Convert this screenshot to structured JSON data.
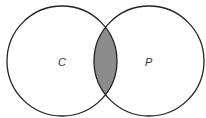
{
  "diagram": {
    "type": "venn",
    "sets": [
      {
        "label": "C",
        "cx": 62,
        "cy": 61,
        "r": 55
      },
      {
        "label": "P",
        "cx": 149,
        "cy": 61,
        "r": 55
      }
    ],
    "shaded_region": "C ∩ P",
    "colors": {
      "stroke": "#222222",
      "shade": "#8c8c8c",
      "background": "#ffffff"
    }
  }
}
